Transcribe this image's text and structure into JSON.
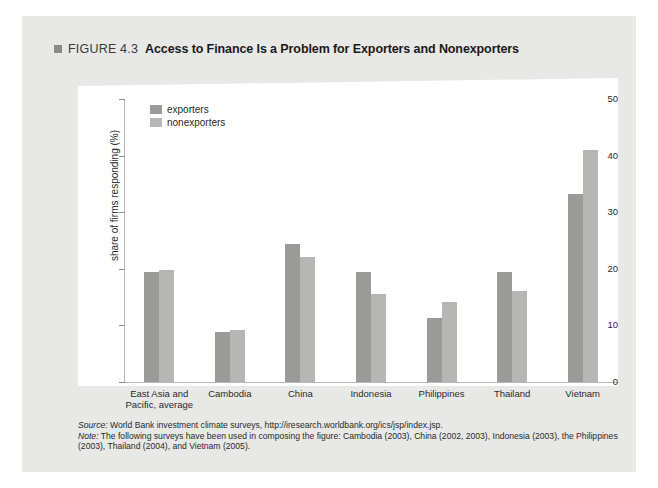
{
  "figure": {
    "marker_icon": "square-marker-icon",
    "label": "FIGURE 4.3",
    "heading": "Access to Finance Is a Problem for Exporters and Nonexporters"
  },
  "colors": {
    "panel_background": "#e8e8e6",
    "plot_background": "#ffffff",
    "exporters": "#9a9a98",
    "nonexporters": "#b6b6b4",
    "axis": "#b8b8b6",
    "text": "#2a2a28"
  },
  "footnotes": {
    "source_label": "Source:",
    "source_text": "World Bank investment climate surveys, http://iresearch.worldbank.org/ics/jsp/index.jsp.",
    "note_label": "Note:",
    "note_text": "The following surveys have been used in composing the figure: Cambodia (2003), China (2002, 2003), Indonesia (2003), the Philippines (2003), Thailand (2004), and Vietnam (2005)."
  },
  "chart_data": {
    "type": "bar",
    "title": "Access to Finance Is a Problem for Exporters and Nonexporters",
    "xlabel": "",
    "ylabel": "share of firms responding (%)",
    "ylim": [
      0,
      50
    ],
    "yticks": [
      0,
      10,
      20,
      30,
      40,
      50
    ],
    "grid": false,
    "legend_position": "top-left",
    "categories": [
      "East Asia and Pacific, average",
      "Cambodia",
      "China",
      "Indonesia",
      "Philippines",
      "Thailand",
      "Vietnam"
    ],
    "series": [
      {
        "name": "exporters",
        "color": "#9a9a98",
        "values": [
          19.5,
          8.8,
          24.3,
          19.5,
          11.3,
          19.5,
          33.2
        ]
      },
      {
        "name": "nonexporters",
        "color": "#b6b6b4",
        "values": [
          19.8,
          9.2,
          22.0,
          15.5,
          14.2,
          16.0,
          41.0
        ]
      }
    ]
  }
}
